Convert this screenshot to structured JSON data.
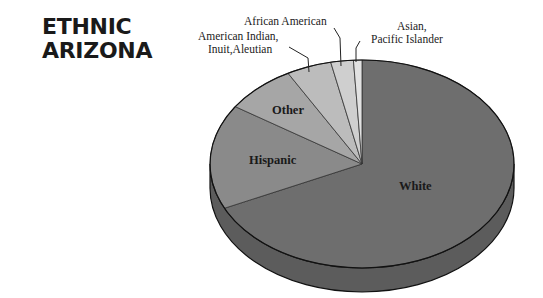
{
  "title": {
    "line1": "ETHNIC",
    "line2": "ARIZONA"
  },
  "chart_data": {
    "type": "pie",
    "style": "3d",
    "title": "ETHNIC ARIZONA",
    "start_angle_deg": 0,
    "direction": "clockwise",
    "slices": [
      {
        "label": "White",
        "value": 68,
        "color": "#6e6e6e"
      },
      {
        "label": "Hispanic",
        "value": 16.3,
        "color": "#8a8a8a"
      },
      {
        "label": "Other",
        "value": 7.6,
        "color": "#a6a6a6"
      },
      {
        "label": "American Indian, Inuit,Aleutian",
        "value": 4.8,
        "color": "#bcbcbc"
      },
      {
        "label": "African American",
        "value": 2.4,
        "color": "#cfcfcf"
      },
      {
        "label": "Asian, Pacific Islander",
        "value": 0.9,
        "color": "#e2e2e2"
      }
    ],
    "legend": "none",
    "side_color": "#5c5c5c"
  },
  "labels": {
    "white": "White",
    "hispanic": "Hispanic",
    "other": "Other",
    "am_indian_1": "American Indian,",
    "am_indian_2": "Inuit,Aleutian",
    "african_american": "African American",
    "asian_1": "Asian,",
    "asian_2": "Pacific Islander"
  }
}
